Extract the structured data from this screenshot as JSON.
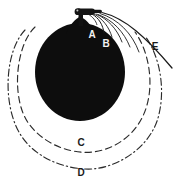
{
  "figure": {
    "type": "technical-line-diagram",
    "background_color": "#ffffff",
    "ink_color": "#1a1a1a",
    "body_fill": "#0d0d0d",
    "label_light_color": "#f2f2f2",
    "labels": [
      {
        "id": "A",
        "text": "A",
        "x": 92,
        "y": 38,
        "tone": "light",
        "refers_to": "inner-streamline"
      },
      {
        "id": "B",
        "text": "B",
        "x": 105,
        "y": 47,
        "tone": "light",
        "refers_to": "outer-streamline"
      },
      {
        "id": "C",
        "text": "C",
        "x": 81,
        "y": 146,
        "tone": "dark",
        "refers_to": "inner-dashed-arc"
      },
      {
        "id": "D",
        "text": "D",
        "x": 81,
        "y": 175,
        "tone": "dark",
        "refers_to": "outer-dashdot-arc"
      },
      {
        "id": "E",
        "text": "E",
        "x": 155,
        "y": 50,
        "tone": "dark",
        "refers_to": "outermost-solid-curve"
      }
    ],
    "elements": {
      "body": {
        "name": "filled-dark-disk",
        "cx": 80,
        "cy": 71,
        "rx": 45,
        "ry": 49
      },
      "nozzle": {
        "name": "nozzle-cap",
        "x": 74,
        "y": 8,
        "width": 22,
        "height": 9
      },
      "neck": {
        "name": "neck-stem",
        "x": 79,
        "y": 15,
        "width": 5,
        "height": 10
      },
      "inner_arc": {
        "name": "inner-dashed-arc",
        "style": "dashed",
        "cx": 80,
        "cy": 76,
        "rx": 62,
        "ry": 64
      },
      "outer_arc": {
        "name": "outer-dashdot-arc",
        "style": "dash-dot",
        "cx": 80,
        "cy": 80,
        "rx": 74,
        "ry": 79
      },
      "streamlines": {
        "name": "streamline-curves",
        "count": 6,
        "style": "solid-thin"
      }
    }
  }
}
